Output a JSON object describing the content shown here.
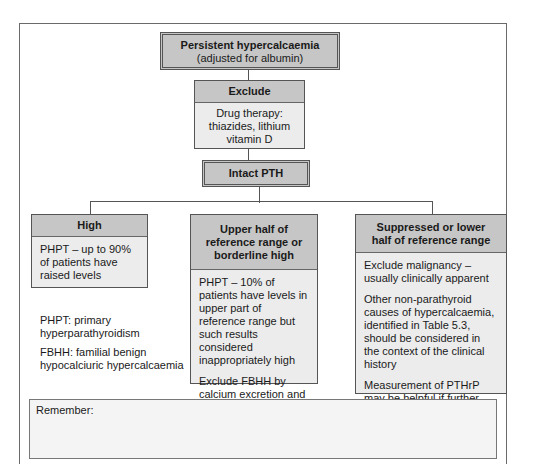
{
  "diagram": {
    "top": {
      "line1": "Persistent hypercalcaemia",
      "line2": "(adjusted for albumin)"
    },
    "exclude": {
      "title": "Exclude",
      "lines": [
        "Drug therapy:",
        "thiazides, lithium",
        "vitamin D"
      ]
    },
    "pth": {
      "title": "Intact PTH"
    },
    "branches": [
      {
        "title": "High",
        "paragraphs": [
          "PHPT – up to 90% of patients have raised levels"
        ]
      },
      {
        "title": "Upper half of reference range or borderline high",
        "paragraphs": [
          "PHPT – 10% of patients have levels in upper part of reference range but such results considered inappropriately high",
          "Exclude FBHH by calcium excretion and family studies – see text"
        ]
      },
      {
        "title": "Suppressed or lower half of reference range",
        "paragraphs": [
          "Exclude malignancy – usually clinically apparent",
          "Other non-parathyroid causes of hypercalcaemia, identified in Table 5.3, should be considered in the  context of the clinical history",
          "Measurement of PTHrP may be helpful if further clinical and laboratory evaluation does not yield a diagnosis"
        ]
      }
    ],
    "legend": [
      "PHPT: primary hyperparathyroidism",
      "FBHH: familial benign hypocalciuric hypercalcaemia"
    ],
    "remember": "Remember:"
  }
}
